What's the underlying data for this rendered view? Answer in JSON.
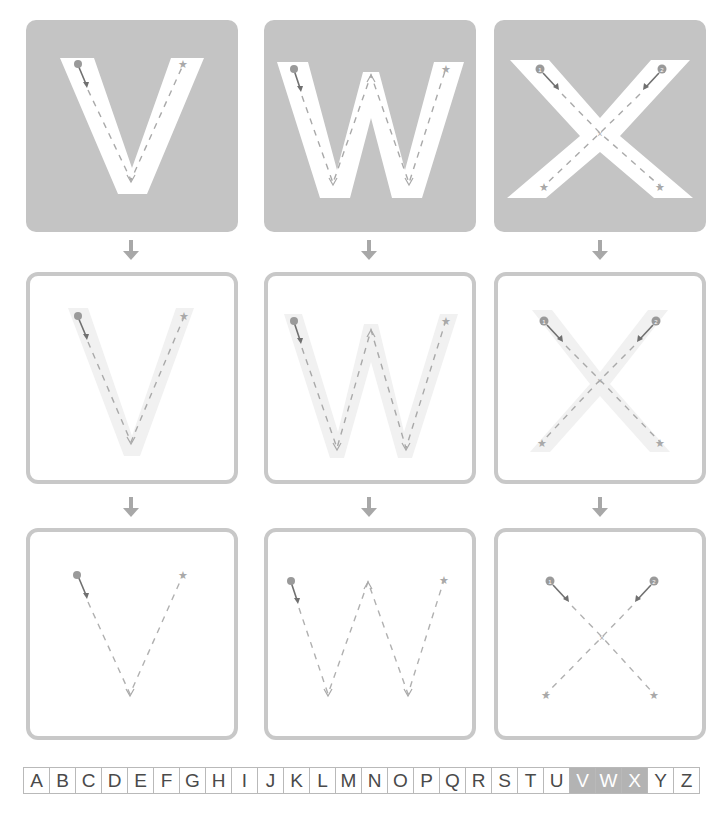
{
  "worksheet": {
    "letters": [
      {
        "letter": "V",
        "stroke_start_markers": [
          "circle"
        ],
        "end_marker": "star"
      },
      {
        "letter": "W",
        "stroke_start_markers": [
          "circle"
        ],
        "end_marker": "star"
      },
      {
        "letter": "X",
        "stroke_start_markers": [
          "circle-1",
          "circle-2"
        ],
        "end_marker": "star"
      }
    ],
    "rows": [
      {
        "name": "solid-letter-row",
        "style": "filled gray box with white letter and dashed guide"
      },
      {
        "name": "faint-letter-row",
        "style": "outlined box with faint letter and dashed guide"
      },
      {
        "name": "dashed-only-row",
        "style": "outlined box with dashed guide only"
      }
    ]
  },
  "colors": {
    "box_fill": "#c4c4c4",
    "box_border": "#c8c8c8",
    "letter_fill": "#ffffff",
    "faint_letter": "#f1f1f1",
    "guide_dash": "#a9a9a9",
    "start_marker": "#9a9a9a",
    "arrow": "#a8a8a8",
    "alphabet_highlight": "#b3b3b3"
  },
  "alphabet": {
    "letters": [
      "A",
      "B",
      "C",
      "D",
      "E",
      "F",
      "G",
      "H",
      "I",
      "J",
      "K",
      "L",
      "M",
      "N",
      "O",
      "P",
      "Q",
      "R",
      "S",
      "T",
      "U",
      "V",
      "W",
      "X",
      "Y",
      "Z"
    ],
    "highlighted": [
      "V",
      "W",
      "X"
    ]
  }
}
